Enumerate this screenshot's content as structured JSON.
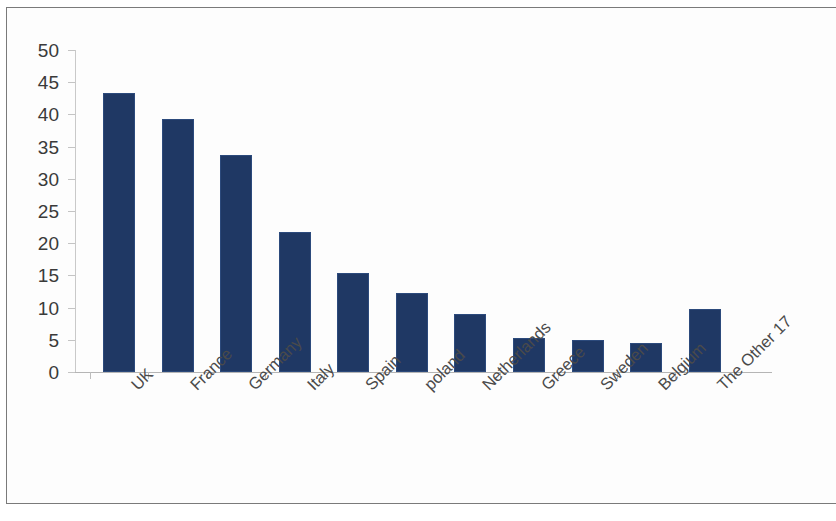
{
  "chart_data": {
    "type": "bar",
    "title": "",
    "subtitle": "",
    "xlabel": "",
    "ylabel": "",
    "categories": [
      "UK",
      "France",
      "Germany",
      "Italy",
      "Spain",
      "poland",
      "Netherlands",
      "Greece",
      "Sweden",
      "Belgium",
      "The Other 17"
    ],
    "values": [
      43.3,
      39.3,
      33.7,
      21.8,
      15.3,
      12.2,
      9.0,
      5.3,
      4.9,
      4.5,
      9.8
    ],
    "series": [
      {
        "name": "Share",
        "values": [
          43.3,
          39.3,
          33.7,
          21.8,
          15.3,
          12.2,
          9.0,
          5.3,
          4.9,
          4.5,
          9.8
        ]
      }
    ],
    "ylim": [
      0,
      50
    ],
    "y_ticks": [
      0,
      5,
      10,
      15,
      20,
      25,
      30,
      35,
      40,
      45,
      50
    ],
    "y_tick_labels": [
      "0",
      "5",
      "10",
      "15",
      "20",
      "25",
      "30",
      "35",
      "40",
      "45",
      "50"
    ],
    "grid": false,
    "legend": false,
    "legend_position": "none",
    "bar_color": "#1F3864",
    "axis_color": "#C4C4C4",
    "label_color": "#4A4A4A",
    "x_label_rotation": -45,
    "background": "#FFFFFF",
    "frame_border_color": "#7A7A7A"
  }
}
